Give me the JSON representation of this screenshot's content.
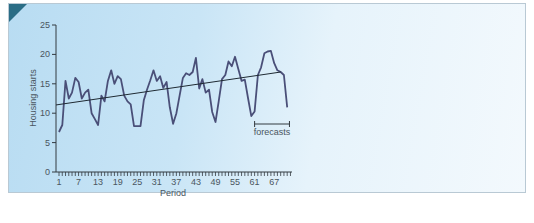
{
  "chart_data": {
    "type": "line",
    "title": "",
    "xlabel": "Period",
    "ylabel": "Housing starts",
    "ylim": [
      0,
      25
    ],
    "yticks": [
      0,
      5,
      10,
      15,
      20,
      25
    ],
    "xticks": [
      1,
      7,
      13,
      19,
      25,
      31,
      37,
      43,
      49,
      55,
      61,
      67
    ],
    "grid": false,
    "legend": null,
    "series": [
      {
        "name": "Housing starts",
        "x": [
          1,
          2,
          3,
          4,
          5,
          6,
          7,
          8,
          9,
          10,
          11,
          12,
          13,
          14,
          15,
          16,
          17,
          18,
          19,
          20,
          21,
          22,
          23,
          24,
          25,
          26,
          27,
          28,
          29,
          30,
          31,
          32,
          33,
          34,
          35,
          36,
          37,
          38,
          39,
          40,
          41,
          42,
          43,
          44,
          45,
          46,
          47,
          48,
          49,
          50,
          51,
          52,
          53,
          54,
          55,
          56,
          57,
          58,
          59,
          60,
          61,
          62,
          63,
          64,
          65,
          66,
          67,
          68,
          69,
          70,
          71
        ],
        "values": [
          6.8,
          8,
          15.5,
          12.5,
          13.5,
          16,
          15.3,
          12.5,
          13.5,
          14,
          10,
          9,
          8,
          13,
          12,
          15.5,
          17.3,
          15,
          16.3,
          15.8,
          13,
          12,
          11.5,
          7.8,
          7.8,
          7.8,
          12.2,
          14,
          15.6,
          17.3,
          15.5,
          16.3,
          14.3,
          15.3,
          11,
          8.2,
          10,
          13,
          16,
          16.8,
          16.5,
          17,
          19.4,
          14.2,
          15.8,
          13.5,
          14,
          10.2,
          8.5,
          12,
          15.8,
          16.5,
          18.8,
          18,
          19.6,
          17.5,
          15.5,
          15.7,
          12.5,
          9.5,
          10.3,
          16.5,
          17.8,
          20.2,
          20.5,
          20.6,
          18.5,
          17.3,
          17,
          16.5,
          11
        ]
      },
      {
        "name": "Trend",
        "x": [
          0,
          69
        ],
        "values": [
          11.4,
          17
        ]
      }
    ],
    "annotations": [
      {
        "text": "forecasts",
        "x_range": [
          61,
          72
        ]
      }
    ]
  },
  "labels": {
    "xlabel": "Period",
    "ylabel": "Housing starts",
    "forecasts": "forecasts",
    "yticks": [
      "0",
      "5",
      "10",
      "15",
      "20",
      "25"
    ],
    "xticks": [
      "1",
      "7",
      "13",
      "19",
      "25",
      "31",
      "37",
      "43",
      "49",
      "55",
      "61",
      "67"
    ]
  },
  "colors": {
    "line": "#4a4f78",
    "trend": "#1f2a33",
    "axis": "#333a40",
    "corner": "#2a6d86"
  }
}
